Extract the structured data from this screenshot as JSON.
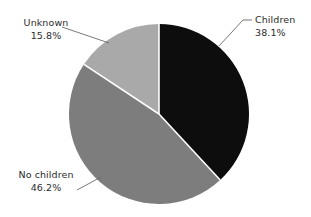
{
  "background_color": "#ffffff",
  "text_color": "#2b2b2b",
  "chart_data": {
    "type": "pie",
    "title": "",
    "subtitle": "",
    "xlabel": "",
    "ylabel": "",
    "legend_position": "callout-labels",
    "grid": false,
    "start_angle_deg": 0,
    "direction": "clockwise",
    "center": {
      "x": 159,
      "y": 114
    },
    "radius": 90,
    "separator_color": "#ffffff",
    "separator_width": 1.6,
    "categories": [
      "Children",
      "No children",
      "Unknown"
    ],
    "values": [
      38.1,
      46.2,
      15.8
    ],
    "value_suffix": "%",
    "colors": [
      "#0d0d0d",
      "#7d7d7d",
      "#a9a9a9"
    ],
    "slices": [
      {
        "label": "Children",
        "value": 38.1,
        "value_text": "38.1%",
        "color": "#0d0d0d",
        "start_deg": 0,
        "end_deg": 137.16
      },
      {
        "label": "No children",
        "value": 46.2,
        "value_text": "46.2%",
        "color": "#7d7d7d",
        "start_deg": 137.16,
        "end_deg": 303.48
      },
      {
        "label": "Unknown",
        "value": 15.8,
        "value_text": "15.8%",
        "color": "#a9a9a9",
        "start_deg": 303.48,
        "end_deg": 360
      }
    ]
  },
  "labels": {
    "children": {
      "name": "Children",
      "value": "38.1%"
    },
    "no_children": {
      "name": "No children",
      "value": "46.2%"
    },
    "unknown": {
      "name": "Unknown",
      "value": "15.8%"
    }
  },
  "leader_lines": {
    "color": "#6a6a6a",
    "width": 0.9,
    "children": "M 252 20 L 243 20 L 219 46",
    "unknown": "M 62 27 L 109 43",
    "no_children": "M 77 190 L 101 177"
  }
}
